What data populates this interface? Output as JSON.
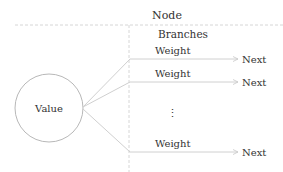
{
  "diagram": {
    "node_label": "Node",
    "branches_label": "Branches",
    "value_label": "Value",
    "ellipsis": "⋮",
    "branches": [
      {
        "weight_label": "Weight",
        "next_label": "Next"
      },
      {
        "weight_label": "Weight",
        "next_label": "Next"
      },
      {
        "weight_label": "Weight",
        "next_label": "Next"
      }
    ],
    "colors": {
      "line": "#d0d0d0",
      "dashed": "#d6d6d6",
      "circle": "#b8b8b8",
      "text": "#333333"
    }
  }
}
